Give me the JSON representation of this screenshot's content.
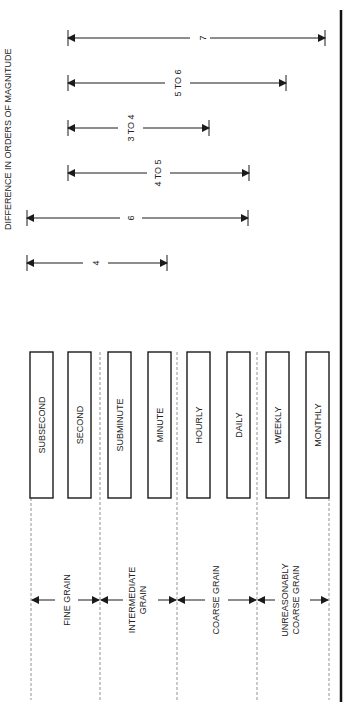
{
  "title": "DIFFERENCE IN ORDERS OF MAGNITUDE",
  "granularities": [
    "SUBSECOND",
    "SECOND",
    "SUBMINUTE",
    "MINUTE",
    "HOURLY",
    "DAILY",
    "WEEKLY",
    "MONTHLY"
  ],
  "grains": [
    {
      "label1": "FINE GRAIN",
      "label2": ""
    },
    {
      "label1": "INTERMEDIATE",
      "label2": "GRAIN"
    },
    {
      "label1": "COARSE GRAIN",
      "label2": ""
    },
    {
      "label1": "UNREASONABLY",
      "label2": "COARSE GRAIN"
    }
  ],
  "spans": [
    {
      "label": "7",
      "from": "SECOND",
      "to": "MONTHLY"
    },
    {
      "label": "5 TO 6",
      "from": "SECOND",
      "to": "WEEKLY"
    },
    {
      "label": "3 TO 4",
      "from": "SECOND",
      "to": "HOURLY"
    },
    {
      "label": "4 TO 5",
      "from": "SECOND",
      "to": "DAILY"
    },
    {
      "label": "6",
      "from": "SUBSECOND",
      "to": "DAILY"
    },
    {
      "label": "4",
      "from": "SUBSECOND",
      "to": "MINUTE"
    }
  ]
}
